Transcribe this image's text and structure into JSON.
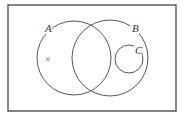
{
  "diagram": {
    "type": "venn",
    "universal_set": {
      "x": 8,
      "y": 5,
      "width": 168,
      "height": 106,
      "stroke": "#444444"
    },
    "sets": [
      {
        "label": "A",
        "cx": 74,
        "cy": 58,
        "r": 37,
        "label_x": 46,
        "label_y": 32
      },
      {
        "label": "B",
        "cx": 110,
        "cy": 58,
        "r": 38,
        "label_x": 133,
        "label_y": 32
      },
      {
        "label": "C",
        "cx": 129,
        "cy": 59,
        "r": 14,
        "label_x": 136,
        "label_y": 54
      }
    ],
    "relationships": [
      "A and B overlap",
      "C is a subset of B",
      "C is disjoint from A"
    ],
    "marker": {
      "symbol": "×",
      "x": 49,
      "y": 59,
      "region": "A only"
    },
    "stroke_color": "#555555"
  }
}
